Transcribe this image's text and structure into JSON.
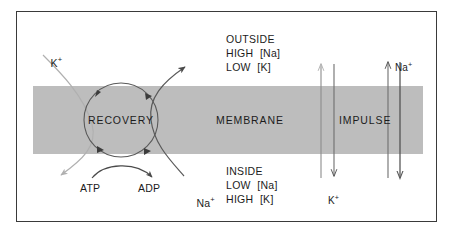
{
  "diagram": {
    "colors": {
      "membrane_fill": "#bdbdbd",
      "frame_border": "#3a3a3a",
      "ink": "#1c1c1c",
      "dark_curve": "#555555",
      "light_curve": "#aaaaaa",
      "background": "#ffffff"
    },
    "membrane_label": "MEMBRANE",
    "recovery_label": "RECOVERY",
    "impulse_label": "IMPULSE",
    "outside": {
      "heading": "OUTSIDE",
      "line2": "HIGH  [Na]",
      "line3": "LOW  [K]"
    },
    "inside": {
      "heading": "INSIDE",
      "line2": "LOW  [Na]",
      "line3": "HIGH  [K]"
    },
    "ions": {
      "k_top_left": "K",
      "k_top_left_charge": "+",
      "na_pump_bottom": "Na",
      "na_pump_bottom_charge": "+",
      "k_impulse": "K",
      "k_impulse_charge": "+",
      "na_impulse": "Na",
      "na_impulse_charge": "+"
    },
    "reaction": {
      "substrate": "ATP",
      "product": "ADP"
    }
  }
}
